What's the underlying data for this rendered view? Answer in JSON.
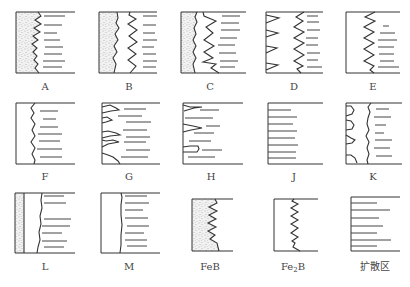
{
  "figure": {
    "type": "morphology classification diagram of boride layer / diffusion zone interface",
    "panels": [
      {
        "id": "A",
        "label": "A",
        "description": "stippled layer with jagged saw-tooth interface, horizontal lines (diffusion zone) to right"
      },
      {
        "id": "B",
        "label": "B",
        "description": "stippled layer with rough edge plus second wavy saw-tooth layer, horizontal lines to right"
      },
      {
        "id": "C",
        "label": "C",
        "description": "stippled layer with rough edge, open saw-tooth layer, horizontal lines to right"
      },
      {
        "id": "D",
        "label": "D",
        "description": "isolated triangular spikes at surface plus zig-zag layer, horizontal lines to right"
      },
      {
        "id": "E",
        "label": "E",
        "description": "zig-zag saw-tooth layer from surface, horizontal lines to right"
      },
      {
        "id": "F",
        "label": "F",
        "description": "thin slightly wavy smooth layer, horizontal lines to right"
      },
      {
        "id": "G",
        "label": "G",
        "description": "isolated lens/needle shaped projections from surface, horizontal lines"
      },
      {
        "id": "H",
        "label": "H",
        "description": "few isolated needle projections from surface, horizontal lines"
      },
      {
        "id": "J",
        "label": "J",
        "description": "no layer, only horizontal lines (diffusion zone)"
      },
      {
        "id": "K",
        "label": "K",
        "description": "scalloped rounded islands plus wavy layer, horizontal lines"
      },
      {
        "id": "L",
        "label": "L",
        "description": "thin stippled strip with flat interface plus flat layer, horizontal lines"
      },
      {
        "id": "M",
        "label": "M",
        "description": "flat smooth layer, horizontal lines"
      },
      {
        "id": "FeB",
        "label": "FeB",
        "description": "legend: stippled region with saw-tooth edge = FeB phase"
      },
      {
        "id": "Fe2B",
        "label": "Fe",
        "label_sub": "2",
        "label_suffix": "B",
        "description": "legend: saw-tooth outline = Fe2B phase"
      },
      {
        "id": "diffusion",
        "label": "扩散区",
        "description": "legend: horizontal lines = diffusion zone"
      }
    ]
  }
}
